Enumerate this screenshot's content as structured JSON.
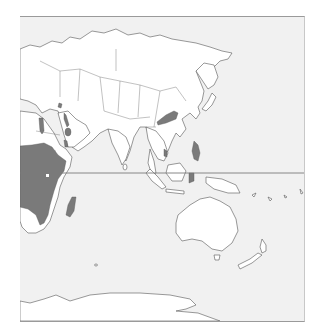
{
  "map": {
    "type": "species-distribution-range-map",
    "region_shown": "Eastern Hemisphere: Africa, Asia, Oceania, Antarctica",
    "colors": {
      "ocean": "#f1f1f1",
      "land": "#ffffff",
      "range": "#7a7a7a",
      "outline": "#555555",
      "equator": "#7a7a7a"
    },
    "features": [
      {
        "name": "equator-line",
        "visible": true
      },
      {
        "name": "range-sub-saharan-africa",
        "shaded": true
      },
      {
        "name": "range-madagascar",
        "shaded": true
      },
      {
        "name": "range-nile-valley",
        "shaded": true
      },
      {
        "name": "range-arabian-peninsula-patches",
        "shaded": true
      },
      {
        "name": "range-levant",
        "shaded": true
      },
      {
        "name": "range-eastern-china",
        "shaded": true
      },
      {
        "name": "range-vietnam",
        "shaded": true
      },
      {
        "name": "range-philippines",
        "shaded": true
      },
      {
        "name": "range-indonesia-sulawesi",
        "shaded": true
      }
    ]
  }
}
